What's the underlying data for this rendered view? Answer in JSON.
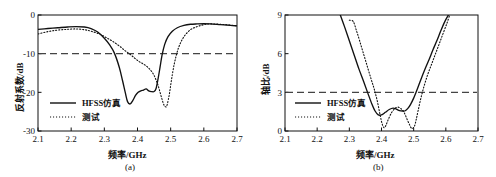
{
  "figure": {
    "background": "#ffffff",
    "line_color": "#111111",
    "threshold_color": "#444444"
  },
  "chart_data": [
    {
      "type": "line",
      "panel": "a",
      "caption": "(a)",
      "title": "",
      "xlabel": "频率/GHz",
      "ylabel": "反射系数/dB",
      "xlim": [
        2.1,
        2.7
      ],
      "ylim": [
        -30,
        0
      ],
      "xticks": [
        2.1,
        2.2,
        2.3,
        2.4,
        2.5,
        2.6,
        2.7
      ],
      "xticklabels": [
        "2.1",
        "2.2",
        "2.3",
        "2.4",
        "2.5",
        "2.6",
        "2.7"
      ],
      "yticks": [
        -30,
        -20,
        -10,
        0
      ],
      "yticklabels": [
        "-30",
        "-20",
        "-10",
        "0"
      ],
      "grid": false,
      "legend_position": "lower left",
      "threshold": {
        "value": -10,
        "style": "dashed",
        "label": "-10 dB"
      },
      "series": [
        {
          "name": "HFSS仿真",
          "style": "solid",
          "x": [
            2.1,
            2.13,
            2.16,
            2.19,
            2.215,
            2.24,
            2.26,
            2.28,
            2.3,
            2.315,
            2.33,
            2.345,
            2.355,
            2.363,
            2.37,
            2.378,
            2.386,
            2.394,
            2.402,
            2.41,
            2.418,
            2.426,
            2.434,
            2.442,
            2.45,
            2.456,
            2.462,
            2.468,
            2.474,
            2.482,
            2.492,
            2.505,
            2.52,
            2.54,
            2.56,
            2.58,
            2.6,
            2.62,
            2.65,
            2.68,
            2.7
          ],
          "y": [
            -3.7,
            -3.5,
            -3.3,
            -3.1,
            -3.0,
            -3.1,
            -3.5,
            -4.4,
            -6.0,
            -7.6,
            -9.8,
            -13.5,
            -17.0,
            -20.0,
            -22.4,
            -23.0,
            -22.1,
            -20.8,
            -20.0,
            -19.6,
            -19.4,
            -19.1,
            -19.6,
            -19.8,
            -19.8,
            -19.0,
            -16.5,
            -13.5,
            -10.4,
            -7.6,
            -5.6,
            -4.2,
            -3.3,
            -2.7,
            -2.4,
            -2.3,
            -2.25,
            -2.3,
            -2.5,
            -2.7,
            -2.8
          ]
        },
        {
          "name": "测试",
          "style": "dotted",
          "x": [
            2.1,
            2.13,
            2.16,
            2.19,
            2.215,
            2.24,
            2.26,
            2.285,
            2.305,
            2.325,
            2.345,
            2.362,
            2.378,
            2.392,
            2.404,
            2.416,
            2.428,
            2.438,
            2.448,
            2.456,
            2.462,
            2.468,
            2.474,
            2.48,
            2.486,
            2.49,
            2.496,
            2.503,
            2.512,
            2.524,
            2.54,
            2.56,
            2.58,
            2.6,
            2.62,
            2.65,
            2.68,
            2.7
          ],
          "y": [
            -4.9,
            -4.3,
            -3.9,
            -3.7,
            -3.6,
            -3.8,
            -4.2,
            -4.9,
            -5.8,
            -6.8,
            -8.0,
            -9.2,
            -10.2,
            -11.2,
            -12.0,
            -12.6,
            -13.3,
            -14.1,
            -15.3,
            -16.8,
            -18.2,
            -20.0,
            -21.8,
            -23.3,
            -23.8,
            -23.0,
            -20.5,
            -16.5,
            -12.2,
            -8.4,
            -5.6,
            -3.8,
            -3.0,
            -2.5,
            -2.3,
            -2.4,
            -2.6,
            -2.8
          ]
        }
      ]
    },
    {
      "type": "line",
      "panel": "b",
      "caption": "(b)",
      "title": "",
      "xlabel": "频率/GHz",
      "ylabel": "轴比/dB",
      "xlim": [
        2.1,
        2.7
      ],
      "ylim": [
        0,
        9
      ],
      "xticks": [
        2.1,
        2.2,
        2.3,
        2.4,
        2.5,
        2.6,
        2.7
      ],
      "xticklabels": [
        "2.1",
        "2.2",
        "2.3",
        "2.4",
        "2.5",
        "2.6",
        "2.7"
      ],
      "yticks": [
        0,
        3,
        6,
        9
      ],
      "yticklabels": [
        "0",
        "3",
        "6",
        "9"
      ],
      "grid": false,
      "legend_position": "lower left",
      "threshold": {
        "value": 3,
        "style": "dashed",
        "label": "3 dB"
      },
      "series": [
        {
          "name": "HFSS仿真",
          "style": "solid",
          "x": [
            2.272,
            2.285,
            2.3,
            2.315,
            2.33,
            2.345,
            2.358,
            2.37,
            2.38,
            2.39,
            2.4,
            2.412,
            2.424,
            2.436,
            2.446,
            2.456,
            2.466,
            2.474,
            2.482,
            2.49,
            2.5,
            2.512,
            2.524,
            2.536,
            2.548,
            2.56,
            2.572,
            2.584,
            2.596,
            2.608
          ],
          "y": [
            9.0,
            8.1,
            7.0,
            5.9,
            4.8,
            3.8,
            2.9,
            2.1,
            1.55,
            1.25,
            1.25,
            1.45,
            1.67,
            1.78,
            1.7,
            1.58,
            1.55,
            1.57,
            1.75,
            2.05,
            2.55,
            3.3,
            4.1,
            4.85,
            5.55,
            6.3,
            7.0,
            7.75,
            8.45,
            9.0
          ]
        },
        {
          "name": "测试",
          "style": "dotted",
          "x": [
            2.3,
            2.312,
            2.322,
            2.332,
            2.344,
            2.356,
            2.368,
            2.378,
            2.388,
            2.396,
            2.402,
            2.408,
            2.414,
            2.422,
            2.432,
            2.442,
            2.452,
            2.462,
            2.47,
            2.478,
            2.486,
            2.494,
            2.502,
            2.508,
            2.514,
            2.522,
            2.532,
            2.544,
            2.556,
            2.568,
            2.58,
            2.592,
            2.604,
            2.612
          ],
          "y": [
            8.6,
            8.5,
            7.8,
            7.0,
            6.0,
            5.0,
            4.0,
            3.2,
            2.2,
            1.2,
            0.55,
            0.25,
            0.45,
            0.95,
            1.45,
            1.75,
            1.85,
            1.7,
            1.45,
            1.0,
            0.55,
            0.2,
            0.35,
            0.9,
            1.6,
            2.5,
            3.45,
            4.4,
            5.2,
            6.0,
            6.8,
            7.6,
            8.4,
            9.0
          ]
        }
      ]
    }
  ]
}
